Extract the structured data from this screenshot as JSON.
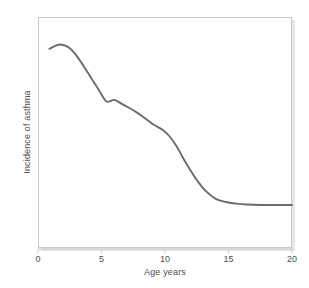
{
  "chart_data": {
    "type": "line",
    "title": "",
    "xlabel": "Age years",
    "ylabel": "Incidence of asthma",
    "xlim": [
      0,
      20
    ],
    "ylim": [
      0,
      1
    ],
    "grid": false,
    "legend": false,
    "xticks": [
      0,
      5,
      10,
      15,
      20
    ],
    "xtick_labels": [
      "0",
      "5",
      "10",
      "15",
      "20"
    ],
    "yticks": [],
    "ytick_labels": [],
    "series": [
      {
        "name": "Incidence of asthma",
        "color": "#6b6b6b",
        "line_width": 1.9,
        "x": [
          0.9,
          1.4,
          1.8,
          2.4,
          3.0,
          3.6,
          4.2,
          4.8,
          5.4,
          6.0,
          6.6,
          7.2,
          7.8,
          8.4,
          9.0,
          9.3,
          9.8,
          10.3,
          10.9,
          11.4,
          12.0,
          12.6,
          13.2,
          14.0,
          14.8,
          15.6,
          16.4,
          17.5,
          18.7,
          20.0
        ],
        "y": [
          0.862,
          0.876,
          0.881,
          0.869,
          0.835,
          0.787,
          0.735,
          0.683,
          0.634,
          0.641,
          0.624,
          0.606,
          0.586,
          0.563,
          0.538,
          0.528,
          0.512,
          0.487,
          0.442,
          0.392,
          0.337,
          0.287,
          0.247,
          0.213,
          0.199,
          0.192,
          0.188,
          0.186,
          0.186,
          0.186
        ]
      }
    ]
  },
  "axes": {
    "x_title": "Age years",
    "y_title": "Incidence of asthma",
    "x_tick_labels": [
      "0",
      "5",
      "10",
      "15",
      "20"
    ]
  },
  "style": {
    "line_color": "#6b6b6b",
    "frame_color": "#c9c9c9",
    "shadow_color": "#e6e6e6",
    "text_color": "#4f4f4f",
    "background": "#ffffff"
  }
}
